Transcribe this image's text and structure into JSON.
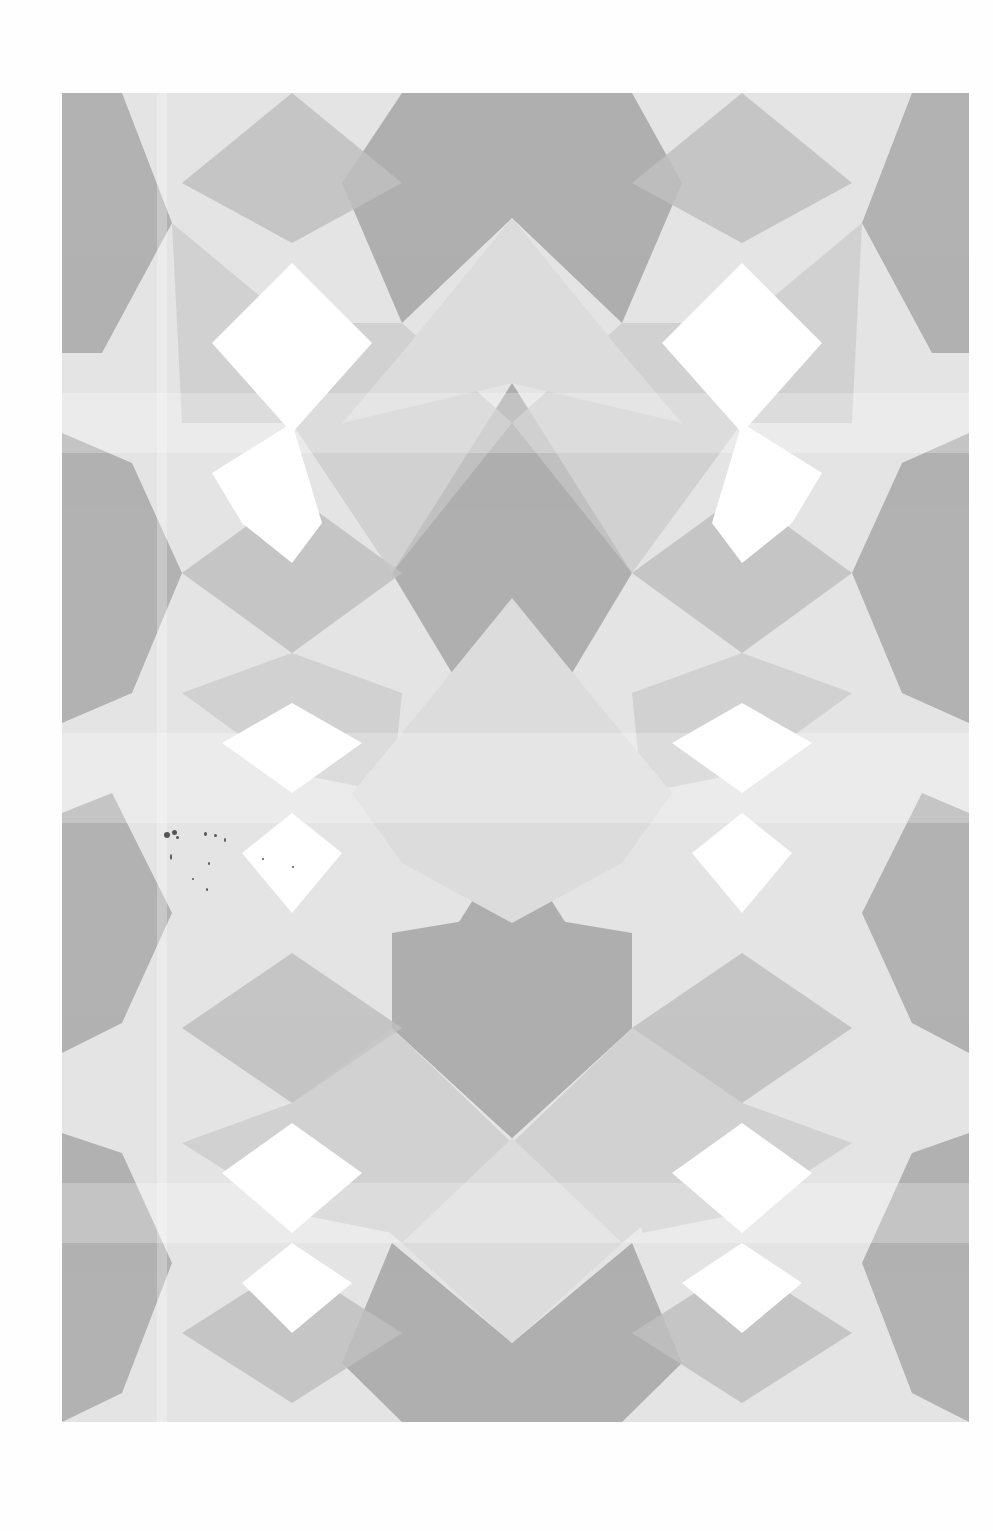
{
  "page": {
    "type": "scanned-page",
    "artwork": {
      "title": "",
      "description": "Symmetric geometric kaleidoscope pattern of overlapping translucent gray triangles and diamonds",
      "palette": {
        "background": "#e6e6e6",
        "dark": "#a9a9a9",
        "mid": "#c4c4c4",
        "light": "#d6d6d6",
        "highlight": "#ffffff",
        "page": "#fefefe"
      },
      "bounds": {
        "left": 62,
        "top": 93,
        "right": 969,
        "bottom": 1422
      }
    },
    "scan_artifacts": {
      "note": "illegible speckle marks near left middle"
    }
  }
}
